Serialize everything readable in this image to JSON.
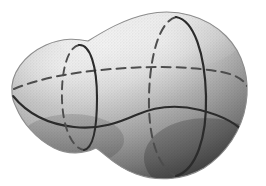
{
  "figure": {
    "title": "Shaded closed surface with cross-section curves",
    "kind": "line-drawing",
    "background_color": "#ffffff",
    "surface": {
      "name": "deformed-sphere",
      "highlight_color": "#f4f4f4",
      "midtone_color": "#c6c6c6",
      "shadow_color": "#5c5c5c",
      "edge_color": "#8a8a8a",
      "lighting": "upper-left highlight, lower-right shadow"
    },
    "curves": [
      {
        "name": "small-cross-section-circle",
        "style": "solid-front-dashed-back",
        "position": "neck",
        "color": "#2b2b2b"
      },
      {
        "name": "large-cross-section-circle",
        "style": "solid-front-dashed-back",
        "position": "bulb",
        "color": "#2b2b2b"
      },
      {
        "name": "equator-curve-hidden",
        "style": "dashed",
        "position": "upper-longitudinal",
        "color": "#4a4a4a"
      },
      {
        "name": "profile-curve-visible",
        "style": "solid",
        "position": "lower-longitudinal",
        "color": "#2b2b2b"
      }
    ],
    "dimensions": {
      "width": 266,
      "height": 186
    }
  }
}
